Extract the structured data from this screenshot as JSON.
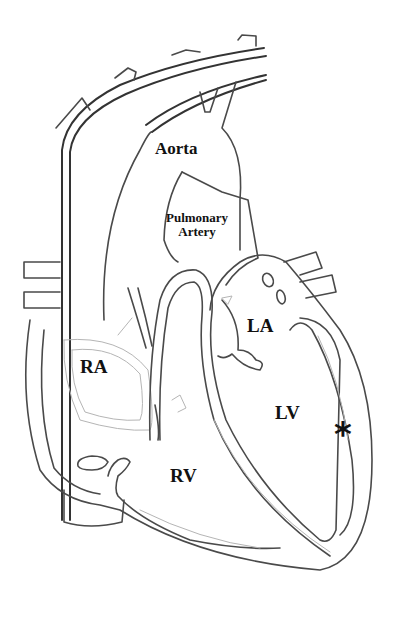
{
  "diagram": {
    "type": "heart-anatomy-cross-section",
    "labels": {
      "aorta": "Aorta",
      "pulmonary_artery_line1": "Pulmonary",
      "pulmonary_artery_line2": "Artery",
      "left_atrium": "LA",
      "right_atrium": "RA",
      "left_ventricle": "LV",
      "right_ventricle": "RV"
    },
    "marker": {
      "symbol": "*",
      "location": "left-ventricle-lateral-wall"
    },
    "colors": {
      "outline": "#4a4a4a",
      "text": "#111111",
      "background": "#ffffff"
    }
  }
}
